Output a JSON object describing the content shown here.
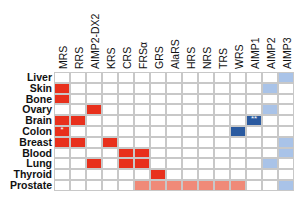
{
  "chart_data": {
    "type": "heatmap",
    "title": "",
    "columns": [
      "MRS",
      "RRS",
      "AIMP2-DX2",
      "KRS",
      "CRS",
      "FRSα",
      "GRS",
      "AlaRS",
      "HRS",
      "NRS",
      "TRS",
      "WRS",
      "AIMP1",
      "AIMP2",
      "AIMP3"
    ],
    "rows": [
      "Liver",
      "Skin",
      "Bone",
      "Ovary",
      "Brain",
      "Colon",
      "Breast",
      "Blood",
      "Lung",
      "Thyroid",
      "Prostate"
    ],
    "legend_codes": {
      "0": "none",
      "R": "strong red",
      "L": "light red",
      "B": "dark blue",
      "b": "light blue"
    },
    "colors": {
      "R": "#e8301c",
      "L": "#f08a78",
      "B": "#2a5aa0",
      "b": "#a9c3e8",
      "0": "#ffffff"
    },
    "values": [
      [
        "0",
        "0",
        "0",
        "0",
        "0",
        "0",
        "0",
        "0",
        "0",
        "0",
        "0",
        "0",
        "0",
        "0",
        "b"
      ],
      [
        "R",
        "0",
        "0",
        "0",
        "0",
        "0",
        "0",
        "0",
        "0",
        "0",
        "0",
        "0",
        "0",
        "b",
        "0"
      ],
      [
        "R",
        "0",
        "0",
        "0",
        "0",
        "0",
        "0",
        "0",
        "0",
        "0",
        "0",
        "0",
        "0",
        "0",
        "0"
      ],
      [
        "0",
        "0",
        "R",
        "0",
        "0",
        "0",
        "0",
        "0",
        "0",
        "0",
        "0",
        "0",
        "0",
        "b",
        "0"
      ],
      [
        "R",
        "R",
        "0",
        "0",
        "0",
        "0",
        "0",
        "0",
        "0",
        "0",
        "0",
        "0",
        "B",
        "0",
        "0"
      ],
      [
        "R",
        "0",
        "0",
        "0",
        "0",
        "0",
        "0",
        "0",
        "0",
        "0",
        "0",
        "B",
        "0",
        "0",
        "0"
      ],
      [
        "R",
        "R",
        "0",
        "R",
        "0",
        "0",
        "0",
        "0",
        "0",
        "0",
        "0",
        "0",
        "0",
        "0",
        "b"
      ],
      [
        "0",
        "0",
        "0",
        "0",
        "R",
        "R",
        "0",
        "0",
        "0",
        "0",
        "0",
        "0",
        "0",
        "0",
        "b"
      ],
      [
        "0",
        "0",
        "R",
        "0",
        "R",
        "R",
        "0",
        "0",
        "0",
        "0",
        "0",
        "0",
        "0",
        "b",
        "0"
      ],
      [
        "0",
        "0",
        "0",
        "0",
        "0",
        "0",
        "R",
        "0",
        "0",
        "0",
        "0",
        "0",
        "0",
        "0",
        "0"
      ],
      [
        "0",
        "0",
        "0",
        "0",
        "0",
        "L",
        "L",
        "L",
        "L",
        "L",
        "L",
        "L",
        "0",
        "0",
        "b"
      ]
    ],
    "annotations": [
      {
        "row": "Colon",
        "column": "MRS",
        "text": "*"
      },
      {
        "row": "Brain",
        "column": "AIMP1",
        "text": "**"
      }
    ],
    "grid": true
  }
}
